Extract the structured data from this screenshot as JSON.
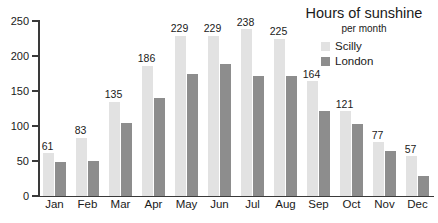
{
  "chart_data": {
    "type": "bar",
    "title": "Hours of sunshine",
    "subtitle": "per month",
    "xlabel": "",
    "ylabel": "",
    "ylim": [
      0,
      250
    ],
    "yticks": [
      0,
      50,
      100,
      150,
      200,
      250
    ],
    "grid": false,
    "legend_position": "top-right",
    "categories": [
      "Jan",
      "Feb",
      "Mar",
      "Apr",
      "May",
      "Jun",
      "Jul",
      "Aug",
      "Sep",
      "Oct",
      "Nov",
      "Dec"
    ],
    "series": [
      {
        "name": "Scilly",
        "color": "#e2e2e2",
        "values": [
          61,
          83,
          135,
          186,
          229,
          229,
          238,
          225,
          164,
          121,
          77,
          57
        ],
        "labels": [
          "61",
          "83",
          "135",
          "186",
          "229",
          "229",
          "238",
          "225",
          "164",
          "121",
          "77",
          "57"
        ]
      },
      {
        "name": "London",
        "color": "#8d8d8d",
        "values": [
          48,
          50,
          105,
          140,
          175,
          189,
          172,
          171,
          121,
          103,
          65,
          28
        ],
        "labels": [
          "",
          "",
          "",
          "",
          "",
          "",
          "",
          "",
          "",
          "",
          "",
          ""
        ]
      }
    ]
  },
  "axis": {
    "tick_labels": [
      "250",
      "200",
      "150",
      "100",
      "50",
      "0"
    ]
  }
}
